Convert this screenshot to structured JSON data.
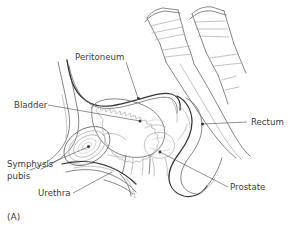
{
  "figure": {
    "panel_label": "(A)",
    "background_color": "#ffffff",
    "line_color_dark": "#343434",
    "line_color_mid": "#6f6f6f",
    "line_color_light": "#a9a9a9",
    "label_color": "#3b3b3b"
  },
  "labels": {
    "peritoneum": "Peritoneum",
    "bladder": "Bladder",
    "symphysis_line1": "Symphysis",
    "symphysis_line2": "pubis",
    "urethra": "Urethra",
    "rectum": "Rectum",
    "prostate": "Prostate"
  }
}
